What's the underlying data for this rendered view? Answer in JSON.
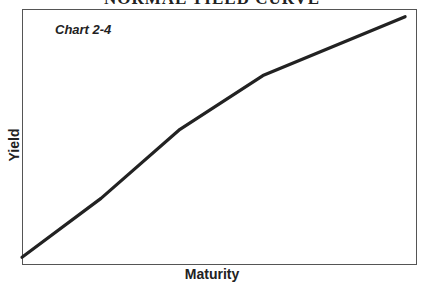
{
  "chart_data": {
    "type": "line",
    "title": "NORMAL YIELD CURVE",
    "subtitle": "Chart 2-4",
    "xlabel": "Maturity",
    "ylabel": "Yield",
    "grid": false,
    "legend": null,
    "x_ticks": [],
    "y_ticks": [],
    "series": [
      {
        "name": "Yield curve",
        "color": "#222222",
        "x": [
          0,
          0.2,
          0.4,
          0.61,
          0.97
        ],
        "y": [
          0.03,
          0.26,
          0.53,
          0.74,
          0.97
        ]
      }
    ],
    "xlim": [
      0,
      1
    ],
    "ylim": [
      0,
      1
    ]
  },
  "header": {
    "title": "NORMAL YIELD CURVE"
  },
  "chart": {
    "label": "Chart 2-4",
    "xlabel": "Maturity",
    "ylabel": "Yield"
  }
}
